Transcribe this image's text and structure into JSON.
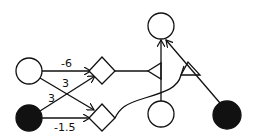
{
  "diagram": {
    "type": "neural-network-schematic",
    "colors": {
      "ink": "#111111",
      "background": "#ffffff"
    },
    "nodes": [
      {
        "id": "input-open",
        "shape": "circle",
        "filled": false
      },
      {
        "id": "input-filled",
        "shape": "circle",
        "filled": true
      },
      {
        "id": "sum-upper",
        "shape": "diamond"
      },
      {
        "id": "sum-lower",
        "shape": "diamond"
      },
      {
        "id": "output-top",
        "shape": "circle",
        "filled": false
      },
      {
        "id": "modulator-bottom",
        "shape": "circle",
        "filled": false
      },
      {
        "id": "modulator-right",
        "shape": "circle",
        "filled": true
      }
    ],
    "weights": {
      "open_to_upper": "-6",
      "open_to_lower": "3",
      "filled_to_upper": "3",
      "filled_to_lower": "-1.5"
    },
    "synapses": [
      {
        "id": "triangle-left",
        "shape": "triangle"
      },
      {
        "id": "triangle-right",
        "shape": "triangle"
      }
    ]
  }
}
